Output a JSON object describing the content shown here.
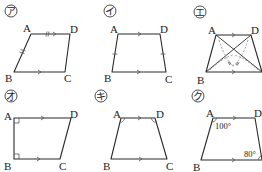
{
  "figures": [
    {
      "id": "a",
      "label": "ア",
      "vertices": {
        "A": "A",
        "B": "B",
        "C": "C",
        "D": "D"
      },
      "marks": [
        "AD ∥ BC (arrows)",
        "AD = AB (double tick)"
      ]
    },
    {
      "id": "i",
      "label": "イ",
      "vertices": {
        "A": "A",
        "B": "B",
        "C": "C",
        "D": "D"
      },
      "marks": [
        "AD ∥ BC (arrows)",
        "AB = DC (single tick)"
      ]
    },
    {
      "id": "e",
      "label": "エ",
      "vertices": {
        "A": "A",
        "B": "B",
        "C": "C",
        "D": "D"
      },
      "marks": [
        "AD ∥ BC (arrows)",
        "diagonals AC and BD drawn",
        "equal diagonals marked"
      ]
    },
    {
      "id": "o",
      "label": "オ",
      "vertices": {
        "A": "A",
        "B": "B",
        "C": "C",
        "D": "D"
      },
      "marks": [
        "AD ∥ BC (arrows)",
        "right angle at A",
        "right angle at B"
      ]
    },
    {
      "id": "ki",
      "label": "キ",
      "vertices": {
        "A": "A",
        "B": "B",
        "C": "C",
        "D": "D"
      },
      "marks": [
        "AD ∥ BC (arrows)",
        "∠A = ∠D (arcs)"
      ]
    },
    {
      "id": "ku",
      "label": "ク",
      "vertices": {
        "A": "A",
        "B": "B",
        "C": "C",
        "D": "D"
      },
      "marks": [
        "AD ∥ BC (arrows)"
      ],
      "angles": {
        "A": "100°",
        "C": "80°"
      }
    }
  ]
}
